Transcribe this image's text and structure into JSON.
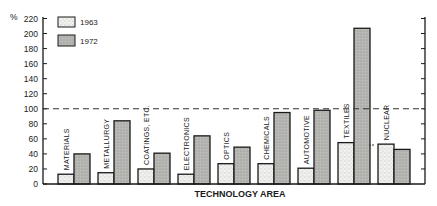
{
  "chart_data": {
    "type": "bar",
    "title": "",
    "xlabel": "TECHNOLOGY AREA",
    "ylabel": "%",
    "ylim": [
      0,
      220
    ],
    "yticks": [
      0,
      20,
      40,
      60,
      80,
      100,
      120,
      140,
      160,
      180,
      200,
      220
    ],
    "reference_line": {
      "value": 100,
      "style": "dashed"
    },
    "grid": false,
    "legend_position": "top-left",
    "categories": [
      "MATERIALS",
      "METALLURGY",
      "COATINGS, ETC.",
      "ELECTRONICS",
      "OPTICS",
      "CHEMICALS",
      "AUTOMOTIVE",
      "TEXTILES",
      "NUCLEAR"
    ],
    "series": [
      {
        "name": "1963",
        "pattern": "stippled-light",
        "values": [
          13,
          15,
          20,
          13,
          27,
          27,
          21,
          55,
          53
        ]
      },
      {
        "name": "1972",
        "pattern": "gray-shaded",
        "values": [
          40,
          84,
          41,
          64,
          49,
          95,
          98,
          207,
          46
        ]
      }
    ]
  },
  "legend": {
    "items": [
      {
        "label": "1963"
      },
      {
        "label": "1972"
      }
    ]
  },
  "axis": {
    "y_unit": "%",
    "x_title": "TECHNOLOGY AREA"
  },
  "colors": {
    "bar_1963": "#e9e9e6",
    "bar_1972": "#b3b3b0",
    "stroke": "#1a1a1a"
  }
}
